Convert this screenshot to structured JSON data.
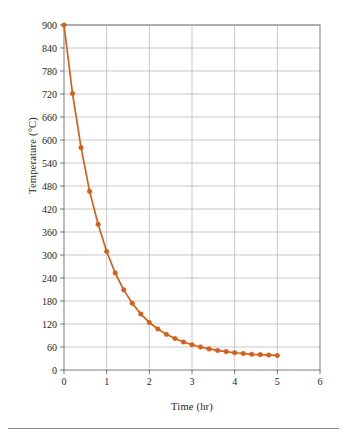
{
  "chart_data": {
    "type": "line",
    "title": "",
    "xlabel": "Time (hr)",
    "ylabel": "Temperature (°C)",
    "xlim": [
      0,
      6
    ],
    "ylim": [
      0,
      900
    ],
    "xticks": [
      0,
      1,
      2,
      3,
      4,
      5,
      6
    ],
    "yticks": [
      0,
      60,
      120,
      180,
      240,
      300,
      360,
      420,
      480,
      540,
      600,
      660,
      720,
      780,
      840,
      900
    ],
    "xtick_labels": [
      "0",
      "1",
      "2",
      "3",
      "4",
      "5",
      "6"
    ],
    "ytick_labels": [
      "0",
      "60",
      "120",
      "180",
      "240",
      "300",
      "360",
      "420",
      "480",
      "540",
      "600",
      "660",
      "720",
      "780",
      "840",
      "900"
    ],
    "grid": true,
    "grid_color": "#b3b3b3",
    "legend": false,
    "series_color": "#d2601a",
    "marker": "circle",
    "series": [
      {
        "name": "Temperature",
        "x": [
          0,
          0.2,
          0.4,
          0.6,
          0.8,
          1.0,
          1.2,
          1.4,
          1.6,
          1.8,
          2.0,
          2.2,
          2.4,
          2.6,
          2.8,
          3.0,
          3.2,
          3.4,
          3.6,
          3.8,
          4.0,
          4.2,
          4.4,
          4.6,
          4.8,
          5.0
        ],
        "y": [
          900,
          721,
          580,
          466,
          380,
          309,
          253,
          209,
          174,
          146,
          124,
          107,
          93,
          82,
          73,
          66,
          60,
          55,
          51,
          48,
          45,
          43,
          41,
          40,
          39,
          38
        ]
      }
    ]
  },
  "axis": {
    "y_title": "Temperature (°C)",
    "x_title": "Time (hr)"
  }
}
